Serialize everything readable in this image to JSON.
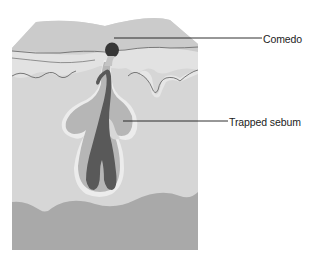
{
  "figure": {
    "type": "anatomical cross-section",
    "labels": [
      {
        "id": "comedo",
        "text": "Comedo"
      },
      {
        "id": "sebum",
        "text": "Trapped sebum"
      }
    ]
  },
  "colors": {
    "background": "#ffffff",
    "epidermis_top": "#cfcfcf",
    "epidermis_band": "#dcdcdc",
    "dermis": "#d6d6d6",
    "dermis_light": "#e4e4e4",
    "subcutis": "#a9a9a9",
    "gland_outer_halo": "#ececec",
    "gland": "#b5b5b5",
    "sebum_core": "#5a5a5a",
    "comedo_plug": "#3a3a3a",
    "boundary_line": "#6e6e6e",
    "leader_line": "#1a1a1a"
  }
}
